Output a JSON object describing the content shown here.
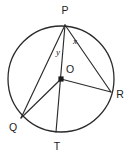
{
  "figure": {
    "background_color": "#ffffff",
    "stroke_color": "#2b2b2b",
    "label_color": "#1c1c1c",
    "circle": {
      "center_x": 61,
      "center_y": 79,
      "radius": 53
    },
    "points": [
      {
        "id": "P",
        "label": "P",
        "x": 65,
        "y": 25,
        "label_x": 65,
        "label_y": 14
      },
      {
        "id": "R",
        "label": "R",
        "x": 111,
        "y": 92,
        "label_x": 120,
        "label_y": 98
      },
      {
        "id": "Q",
        "label": "Q",
        "x": 21,
        "y": 118,
        "label_x": 13,
        "label_y": 131
      },
      {
        "id": "T",
        "label": "T",
        "x": 56,
        "y": 132,
        "label_x": 57,
        "label_y": 150
      },
      {
        "id": "O",
        "label": "O",
        "x": 61,
        "y": 79,
        "label_x": 70,
        "label_y": 73
      }
    ],
    "segments": [
      {
        "id": "PQ",
        "from": "P",
        "to": "Q"
      },
      {
        "id": "PT",
        "from": "P",
        "to": "T"
      },
      {
        "id": "PR",
        "from": "P",
        "to": "R"
      },
      {
        "id": "OQ",
        "from": "O",
        "to": "Q"
      },
      {
        "id": "OR",
        "from": "O",
        "to": "R"
      }
    ],
    "angles": [
      {
        "id": "x",
        "label": "x",
        "x": 75,
        "y": 44,
        "at_vertex": "P",
        "between": [
          "PT",
          "PR"
        ]
      },
      {
        "id": "y",
        "label": "y",
        "x": 58,
        "y": 55,
        "at_vertex": "P",
        "between": [
          "PQ",
          "PT"
        ]
      }
    ]
  }
}
